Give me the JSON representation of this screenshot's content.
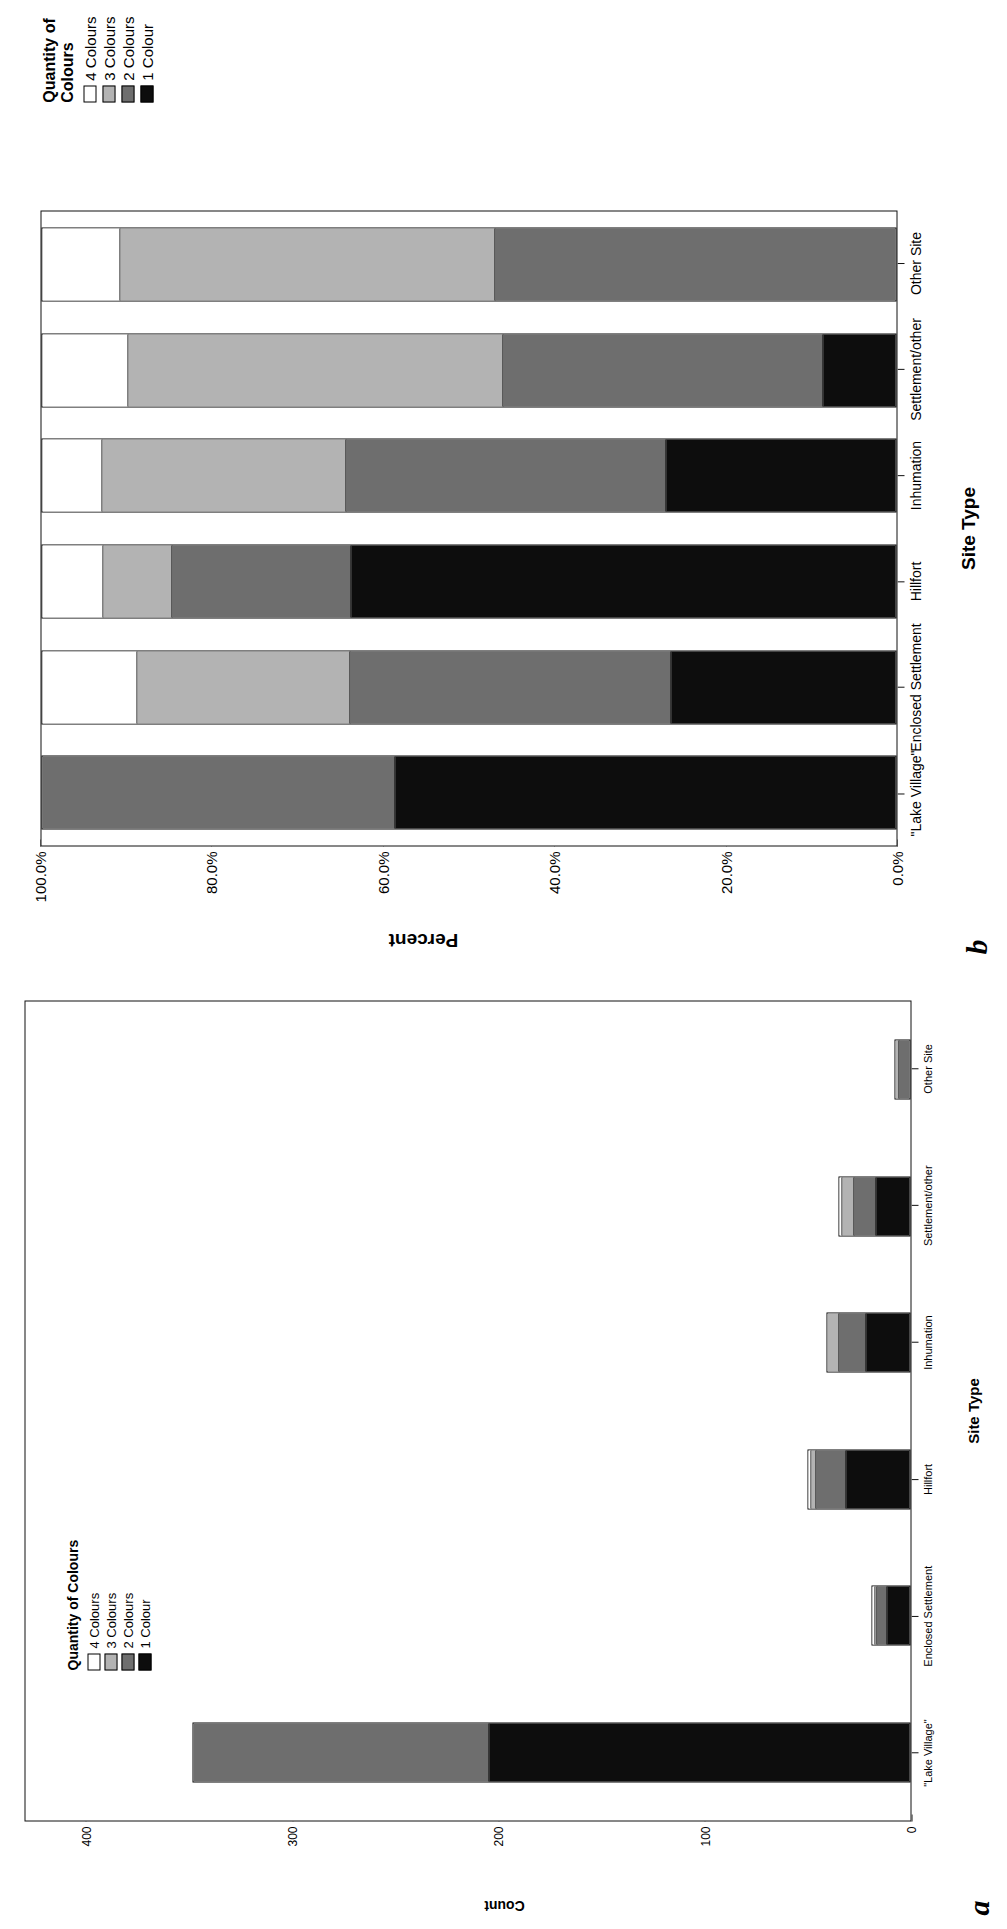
{
  "figure": {
    "panels": [
      {
        "letter": "a",
        "axis": {
          "ylabel": "Count",
          "xlabel": "Site Type",
          "yticks": [
            "400",
            "300",
            "200",
            "100",
            "0"
          ],
          "ytick_values": [
            400,
            300,
            200,
            100,
            0
          ],
          "ymax": 430
        },
        "legend": {
          "title": "Quantity of Colours",
          "items": [
            {
              "label": "4 Colours",
              "color": "#ffffff"
            },
            {
              "label": "3 Colours",
              "color": "#b3b3b3"
            },
            {
              "label": "2 Colours",
              "color": "#6e6e6e"
            },
            {
              "label": "1 Colour",
              "color": "#0d0d0d"
            }
          ]
        }
      },
      {
        "letter": "b",
        "axis": {
          "ylabel": "Percent",
          "xlabel": "Site Type",
          "yticks": [
            "100.0%",
            "80.0%",
            "60.0%",
            "40.0%",
            "20.0%",
            "0.0%"
          ],
          "ytick_values": [
            100,
            80,
            60,
            40,
            20,
            0
          ],
          "ymax": 100
        },
        "legend": {
          "title": "Quantity of\nColours",
          "items": [
            {
              "label": "4 Colours",
              "color": "#ffffff"
            },
            {
              "label": "3 Colours",
              "color": "#b3b3b3"
            },
            {
              "label": "2 Colours",
              "color": "#6e6e6e"
            },
            {
              "label": "1 Colour",
              "color": "#0d0d0d"
            }
          ]
        }
      }
    ]
  },
  "chart_data": [
    {
      "type": "bar",
      "stacked": true,
      "title": "a",
      "xlabel": "Site Type",
      "ylabel": "Count",
      "ylim": [
        0,
        430
      ],
      "yticks": [
        0,
        100,
        200,
        300,
        400
      ],
      "grid": false,
      "legend_position": "inside-top-left",
      "legend_title": "Quantity of Colours",
      "categories": [
        "\"Lake Village\"",
        "Enclosed Settlement",
        "Hillfort",
        "Inhumation",
        "Settlement/other",
        "Other Site"
      ],
      "series": [
        {
          "name": "1 Colour",
          "color": "#0d0d0d",
          "values": [
            205,
            12,
            32,
            22,
            17,
            0
          ]
        },
        {
          "name": "2 Colours",
          "color": "#6e6e6e",
          "values": [
            144,
            5,
            15,
            13,
            11,
            6
          ]
        },
        {
          "name": "3 Colours",
          "color": "#b3b3b3",
          "values": [
            0,
            1,
            2,
            6,
            6,
            2
          ]
        },
        {
          "name": "4 Colours",
          "color": "#ffffff",
          "values": [
            0,
            1,
            1,
            0,
            1,
            0
          ]
        }
      ],
      "totals": [
        349,
        19,
        50,
        41,
        35,
        8
      ]
    },
    {
      "type": "bar",
      "stacked": true,
      "normalized": true,
      "title": "b",
      "xlabel": "Site Type",
      "ylabel": "Percent",
      "ylim": [
        0,
        100
      ],
      "yticks": [
        0,
        20,
        40,
        60,
        80,
        100
      ],
      "grid": false,
      "legend_position": "right",
      "legend_title": "Quantity of Colours",
      "categories": [
        "\"Lake Village\"",
        "Enclosed Settlement",
        "Hillfort",
        "Inhumation",
        "Settlement/other",
        "Other Site"
      ],
      "series": [
        {
          "name": "1 Colour",
          "color": "#0d0d0d",
          "values": [
            58.7,
            26.3,
            64.0,
            27.0,
            8.5,
            0.0
          ]
        },
        {
          "name": "2 Colours",
          "color": "#6e6e6e",
          "values": [
            41.3,
            37.7,
            21.0,
            37.5,
            37.5,
            47.0
          ]
        },
        {
          "name": "3 Colours",
          "color": "#b3b3b3",
          "values": [
            0.0,
            25.0,
            8.0,
            28.5,
            44.0,
            44.0
          ]
        },
        {
          "name": "4 Colours",
          "color": "#ffffff",
          "values": [
            0.0,
            11.0,
            7.0,
            7.0,
            10.0,
            9.0
          ]
        }
      ]
    }
  ]
}
